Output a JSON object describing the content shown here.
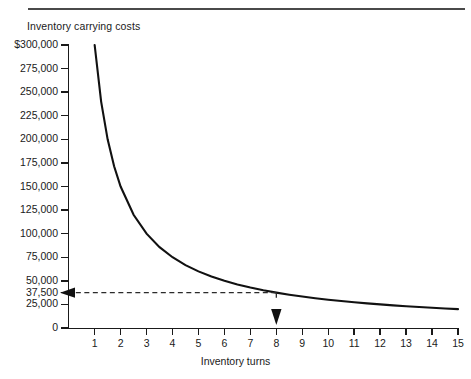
{
  "figure": {
    "top_rule": true,
    "cropped_header_text": "",
    "y_axis_caption": "Inventory carrying costs",
    "x_axis_caption": "Inventory turns"
  },
  "chart_data": {
    "type": "line",
    "title": "",
    "subtitle": "",
    "xlabel": "Inventory turns",
    "ylabel": "Inventory carrying costs",
    "xlim": [
      0,
      15
    ],
    "ylim": [
      0,
      300000
    ],
    "grid": false,
    "legend": "none",
    "relationship": "y = 300000 / x",
    "x_tick_labels": [
      "1",
      "2",
      "3",
      "4",
      "5",
      "6",
      "7",
      "8",
      "9",
      "10",
      "11",
      "12",
      "13",
      "14",
      "15"
    ],
    "x_tick_values": [
      1,
      2,
      3,
      4,
      5,
      6,
      7,
      8,
      9,
      10,
      11,
      12,
      13,
      14,
      15
    ],
    "y_tick_labels": [
      "$300,000",
      "275,000",
      "250,000",
      "225,000",
      "200,000",
      "175,000",
      "150,000",
      "125,000",
      "100,000",
      "75,000",
      "50,000",
      "37,500",
      "25,000",
      "0"
    ],
    "y_tick_values": [
      300000,
      275000,
      250000,
      225000,
      200000,
      175000,
      150000,
      125000,
      100000,
      75000,
      50000,
      37500,
      25000,
      0
    ],
    "series": [
      {
        "name": "Inventory carrying costs",
        "x": [
          1,
          1.25,
          1.5,
          1.75,
          2,
          2.5,
          3,
          3.5,
          4,
          4.5,
          5,
          5.5,
          6,
          6.5,
          7,
          7.5,
          8,
          8.5,
          9,
          9.5,
          10,
          10.5,
          11,
          11.5,
          12,
          12.5,
          13,
          13.5,
          14,
          14.5,
          15
        ],
        "values": [
          300000,
          240000,
          200000,
          171429,
          150000,
          120000,
          100000,
          85714,
          75000,
          66667,
          60000,
          54545,
          50000,
          46154,
          42857,
          40000,
          37500,
          35294,
          33333,
          31579,
          30000,
          28571,
          27273,
          26087,
          25000,
          24000,
          23077,
          22222,
          21429,
          20690,
          20000
        ]
      }
    ],
    "annotations": [
      {
        "name": "horizontal-leader",
        "kind": "dashed-line-with-arrow",
        "from_x": 8,
        "to_x": 0,
        "at_y": 37500,
        "label": "37,500",
        "arrow_direction": "left"
      },
      {
        "name": "vertical-leader",
        "kind": "dashed-line-with-arrow",
        "at_x": 8,
        "from_y": 37500,
        "to_y": 0,
        "label": "8",
        "arrow_direction": "down"
      }
    ]
  }
}
